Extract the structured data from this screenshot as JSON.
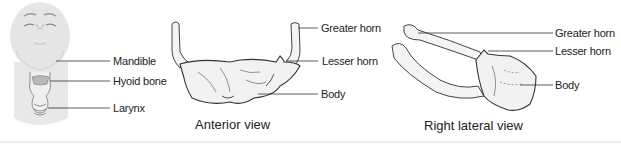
{
  "figure": {
    "panels": [
      {
        "id": "head-neck",
        "labels": [
          "Mandible",
          "Hyoid bone",
          "Larynx"
        ]
      },
      {
        "id": "anterior",
        "caption": "Anterior view",
        "labels": [
          "Greater horn",
          "Lesser horn",
          "Body"
        ]
      },
      {
        "id": "lateral",
        "caption": "Right lateral view",
        "labels": [
          "Greater horn",
          "Lesser horn",
          "Body"
        ]
      }
    ],
    "colors": {
      "skin": "#e6e6e6",
      "hyoid_highlight": "#b9b9b9",
      "outline": "#555555",
      "leader_line": "#333333",
      "bone_fill": "#f4f4f4"
    }
  }
}
